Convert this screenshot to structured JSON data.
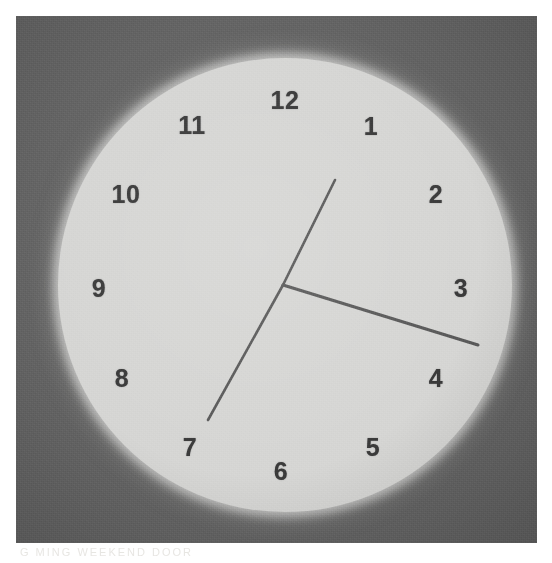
{
  "image": {
    "subject": "analog-wall-clock",
    "width": 552,
    "height": 563,
    "plate_background_color": "#656565",
    "page_background_color": "#ffffff",
    "ghost_text": "G MING     WEEKEND     DOOR"
  },
  "clock": {
    "face_color": "#d6d6d4",
    "numeral_color": "#3a3a3a",
    "hand_color": "#5a5a5a",
    "center_x": 283,
    "center_y": 285,
    "radius": 227,
    "numerals": [
      {
        "label": "12",
        "x": 285,
        "y": 100
      },
      {
        "label": "1",
        "x": 371,
        "y": 126
      },
      {
        "label": "2",
        "x": 436,
        "y": 194
      },
      {
        "label": "3",
        "x": 461,
        "y": 288
      },
      {
        "label": "4",
        "x": 436,
        "y": 378
      },
      {
        "label": "5",
        "x": 373,
        "y": 447
      },
      {
        "label": "6",
        "x": 281,
        "y": 471
      },
      {
        "label": "7",
        "x": 190,
        "y": 447
      },
      {
        "label": "8",
        "x": 122,
        "y": 378
      },
      {
        "label": "9",
        "x": 99,
        "y": 288
      },
      {
        "label": "10",
        "x": 126,
        "y": 194
      },
      {
        "label": "11",
        "x": 192,
        "y": 125
      }
    ],
    "hands": [
      {
        "name": "minute-hand",
        "kind": "minute",
        "tip_x": 335,
        "tip_y": 180,
        "length": 118,
        "angle_deg": 26
      },
      {
        "name": "minute-hand-tail",
        "kind": "minute-tail",
        "tip_x": 208,
        "tip_y": 420,
        "length": 150,
        "angle_deg": 206
      },
      {
        "name": "hour-hand",
        "kind": "hour",
        "tip_x": 478,
        "tip_y": 345,
        "length": 204,
        "angle_deg": 107
      }
    ],
    "reading": {
      "time": "3:25",
      "hour": 3,
      "minute": 25
    }
  }
}
